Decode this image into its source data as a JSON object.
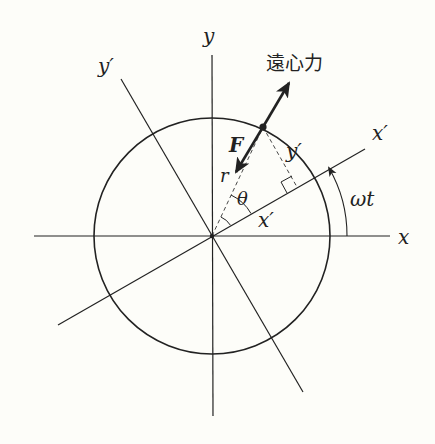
{
  "diagram": {
    "type": "rotating-frame-centrifugal-force",
    "labels": {
      "x_axis": "x",
      "y_axis": "y",
      "x_prime_axis": "x′",
      "y_prime_axis": "y′",
      "x_prime_component": "x′",
      "y_prime_component": "y′",
      "radius": "r",
      "angle_theta": "θ",
      "rotation_angle": "ωt",
      "force": "F",
      "centrifugal_force": "遠心力"
    },
    "geometry": {
      "origin": [
        212,
        236
      ],
      "circle_radius": 118,
      "rotation_angle_deg": 30,
      "theta_deg": 30
    },
    "colors": {
      "stroke": "#222222",
      "background": "#fdfdf9"
    }
  }
}
